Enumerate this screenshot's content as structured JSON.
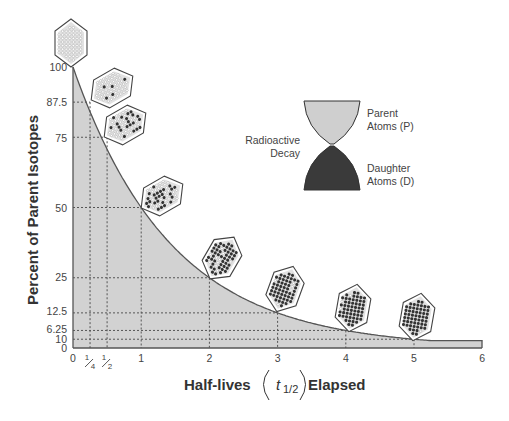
{
  "chart_data": {
    "type": "area",
    "title": "",
    "xlabel": "Half-lives (t1/2) Elapsed",
    "xlabel_parts": {
      "prefix": "Half-lives",
      "symbol": "t",
      "subscript": "1/2",
      "suffix": "Elapsed"
    },
    "ylabel": "Percent of Parent Isotopes",
    "xlim": [
      0,
      6
    ],
    "ylim": [
      0,
      100
    ],
    "x_ticks": [
      {
        "value": 0,
        "label": "0"
      },
      {
        "value": 0.25,
        "label": "1/4",
        "num": "1",
        "den": "4"
      },
      {
        "value": 0.5,
        "label": "1/2",
        "num": "1",
        "den": "2"
      },
      {
        "value": 1,
        "label": "1"
      },
      {
        "value": 2,
        "label": "2"
      },
      {
        "value": 3,
        "label": "3"
      },
      {
        "value": 4,
        "label": "4"
      },
      {
        "value": 5,
        "label": "5"
      },
      {
        "value": 6,
        "label": "6"
      }
    ],
    "y_ticks": [
      {
        "value": 100,
        "label": "100",
        "y": 67
      },
      {
        "value": 87.5,
        "label": "87.5",
        "y": 102
      },
      {
        "value": 75,
        "label": "75",
        "y": 138
      },
      {
        "value": 50,
        "label": "50",
        "y": 208
      },
      {
        "value": 25,
        "label": "25",
        "y": 277
      },
      {
        "value": 12.5,
        "label": "12.5",
        "y": 311
      },
      {
        "value": 6.25,
        "label": "6.25",
        "y": 329
      },
      {
        "value": 3.125,
        "label": "10",
        "y": 339
      },
      {
        "value": 0,
        "label": "0",
        "y": 348
      }
    ],
    "series": [
      {
        "name": "Parent Isotopes",
        "x": [
          0,
          0.25,
          0.5,
          1,
          2,
          3,
          4,
          5,
          6
        ],
        "values": [
          100,
          87.5,
          75,
          50,
          25,
          12.5,
          6.25,
          3.125,
          1.5625
        ]
      }
    ],
    "grid": "dotted guide lines at marked points",
    "annotations": [
      "Crystal icons at each marked point showing increasing proportion of dark (daughter) atoms"
    ],
    "legend": {
      "position": "upper right",
      "label_left": "Radioactive Decay",
      "label_top": "Parent Atoms (P)",
      "label_bottom": "Daughter Atoms (D)"
    }
  },
  "legend": {
    "decay_line1": "Radioactive",
    "decay_line2": "Decay",
    "parent_line1": "Parent",
    "parent_line2": "Atoms (P)",
    "daughter_line1": "Daughter",
    "daughter_line2": "Atoms (D)"
  },
  "colors": {
    "fill": "#d2d2d2",
    "curve": "#555555",
    "parent": "#cfcfcf",
    "daughter": "#3a3a3a",
    "crystal_bg": "#e2e2e2",
    "crystal_dot_light": "#ffffff",
    "crystal_dot_dark": "#333333"
  },
  "crystals": [
    {
      "x": 0,
      "dark_fraction": 0.0,
      "cx": 71,
      "cy": 43,
      "rot": 0
    },
    {
      "x": 0.25,
      "dark_fraction": 0.125,
      "cx": 112,
      "cy": 88,
      "rot": 60
    },
    {
      "x": 0.5,
      "dark_fraction": 0.25,
      "cx": 125,
      "cy": 125,
      "rot": 60
    },
    {
      "x": 1,
      "dark_fraction": 0.5,
      "cx": 162,
      "cy": 196,
      "rot": 60
    },
    {
      "x": 2,
      "dark_fraction": 0.75,
      "cx": 222,
      "cy": 258,
      "rot": 30
    },
    {
      "x": 3,
      "dark_fraction": 0.875,
      "cx": 285,
      "cy": 289,
      "rot": 20
    },
    {
      "x": 4,
      "dark_fraction": 0.9375,
      "cx": 353,
      "cy": 308,
      "rot": 10
    },
    {
      "x": 5,
      "dark_fraction": 0.97,
      "cx": 417,
      "cy": 317,
      "rot": 10
    }
  ]
}
